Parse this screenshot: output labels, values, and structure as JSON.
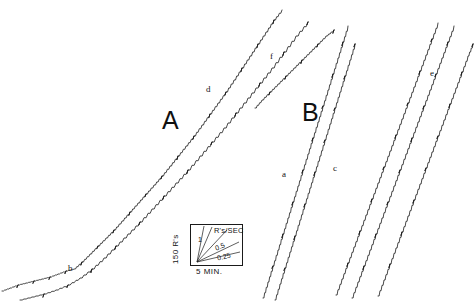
{
  "figure": {
    "background_color": "#ffffff",
    "ink_color": "#1a1a1a",
    "width": 474,
    "height": 305
  },
  "panels": [
    {
      "id": "A",
      "label": "A"
    },
    {
      "id": "B",
      "label": "B"
    }
  ],
  "curve_labels": [
    {
      "id": "b",
      "label": "b",
      "panel": "A",
      "x": 68,
      "y": 264
    },
    {
      "id": "d",
      "label": "d",
      "panel": "A",
      "x": 206,
      "y": 85
    },
    {
      "id": "f",
      "label": "f",
      "panel": "A",
      "x": 270,
      "y": 52
    },
    {
      "id": "a",
      "label": "a",
      "panel": "B",
      "x": 282,
      "y": 170
    },
    {
      "id": "c",
      "label": "c",
      "panel": "B",
      "x": 333,
      "y": 164
    },
    {
      "id": "e",
      "label": "e",
      "panel": "B",
      "x": 430,
      "y": 69
    }
  ],
  "inset": {
    "name": "rate-calibration-inset",
    "y_axis_label": "150 R's",
    "x_axis_label": "5 MIN.",
    "rate_unit_label": "R's/SEC",
    "slope_labels": [
      "1",
      "0.5",
      "0.25"
    ]
  },
  "chart_data": {
    "type": "line",
    "title": "",
    "xlabel": "5 MIN.",
    "ylabel": "150 R's",
    "grid": false,
    "legend": "none",
    "calibration": {
      "y_per_division": 150,
      "y_units": "R's",
      "x_per_division": 5,
      "x_units": "MIN.",
      "rate_unit": "R's/SEC",
      "reference_slopes": [
        1,
        0.5,
        0.25
      ]
    },
    "series": [
      {
        "name": "b",
        "panel": "A",
        "points": [
          [
            2,
            291
          ],
          [
            10,
            288
          ],
          [
            18,
            285
          ],
          [
            26,
            283
          ],
          [
            34,
            281
          ],
          [
            42,
            279
          ],
          [
            50,
            277
          ],
          [
            58,
            274
          ],
          [
            66,
            271
          ],
          [
            74,
            269
          ],
          [
            82,
            262
          ],
          [
            90,
            254
          ],
          [
            98,
            246
          ],
          [
            106,
            238
          ],
          [
            114,
            230
          ],
          [
            122,
            221
          ],
          [
            130,
            212
          ],
          [
            138,
            203
          ],
          [
            146,
            194
          ],
          [
            154,
            185
          ],
          [
            162,
            176
          ],
          [
            170,
            166
          ],
          [
            178,
            156
          ],
          [
            186,
            146
          ],
          [
            194,
            136
          ],
          [
            202,
            125
          ],
          [
            210,
            114
          ],
          [
            218,
            103
          ],
          [
            226,
            92
          ],
          [
            234,
            80
          ],
          [
            242,
            68
          ],
          [
            250,
            56
          ],
          [
            258,
            44
          ],
          [
            266,
            32
          ],
          [
            274,
            20
          ],
          [
            282,
            10
          ]
        ]
      },
      {
        "name": "d",
        "panel": "A",
        "points": [
          [
            20,
            300
          ],
          [
            32,
            297
          ],
          [
            44,
            294
          ],
          [
            56,
            290
          ],
          [
            68,
            285
          ],
          [
            80,
            278
          ],
          [
            92,
            269
          ],
          [
            104,
            258
          ],
          [
            116,
            246
          ],
          [
            128,
            234
          ],
          [
            140,
            222
          ],
          [
            152,
            209
          ],
          [
            164,
            196
          ],
          [
            176,
            183
          ],
          [
            188,
            170
          ],
          [
            200,
            156
          ],
          [
            212,
            142
          ],
          [
            224,
            128
          ],
          [
            236,
            113
          ],
          [
            248,
            98
          ],
          [
            260,
            83
          ],
          [
            272,
            68
          ],
          [
            284,
            52
          ],
          [
            296,
            36
          ],
          [
            308,
            22
          ]
        ]
      },
      {
        "name": "f",
        "panel": "A",
        "points": [
          [
            255,
            108
          ],
          [
            262,
            100
          ],
          [
            270,
            92
          ],
          [
            278,
            84
          ],
          [
            286,
            76
          ],
          [
            294,
            68
          ],
          [
            302,
            60
          ],
          [
            310,
            52
          ],
          [
            318,
            44
          ],
          [
            326,
            36
          ],
          [
            334,
            30
          ]
        ]
      },
      {
        "name": "a",
        "panel": "B",
        "points": [
          [
            263,
            298
          ],
          [
            268,
            282
          ],
          [
            273,
            266
          ],
          [
            278,
            250
          ],
          [
            283,
            234
          ],
          [
            288,
            218
          ],
          [
            293,
            202
          ],
          [
            298,
            186
          ],
          [
            303,
            170
          ],
          [
            308,
            154
          ],
          [
            313,
            138
          ],
          [
            318,
            122
          ],
          [
            323,
            106
          ],
          [
            328,
            90
          ],
          [
            333,
            74
          ],
          [
            338,
            58
          ],
          [
            343,
            42
          ],
          [
            348,
            26
          ]
        ]
      },
      {
        "name": "a2",
        "panel": "B",
        "points": [
          [
            275,
            300
          ],
          [
            280,
            284
          ],
          [
            285,
            268
          ],
          [
            290,
            252
          ],
          [
            295,
            236
          ],
          [
            300,
            220
          ],
          [
            305,
            204
          ],
          [
            310,
            188
          ],
          [
            315,
            172
          ],
          [
            320,
            156
          ],
          [
            325,
            140
          ],
          [
            330,
            124
          ],
          [
            335,
            108
          ],
          [
            340,
            92
          ],
          [
            345,
            76
          ],
          [
            350,
            60
          ],
          [
            355,
            44
          ]
        ]
      },
      {
        "name": "c",
        "panel": "B",
        "points": [
          [
            336,
            295
          ],
          [
            342,
            279
          ],
          [
            348,
            263
          ],
          [
            354,
            247
          ],
          [
            360,
            231
          ],
          [
            366,
            215
          ],
          [
            372,
            199
          ],
          [
            378,
            183
          ],
          [
            384,
            167
          ],
          [
            390,
            151
          ],
          [
            396,
            135
          ],
          [
            402,
            119
          ],
          [
            408,
            103
          ],
          [
            414,
            87
          ],
          [
            420,
            71
          ],
          [
            426,
            55
          ],
          [
            432,
            39
          ],
          [
            438,
            23
          ]
        ]
      },
      {
        "name": "c2",
        "panel": "B",
        "points": [
          [
            352,
            298
          ],
          [
            358,
            282
          ],
          [
            364,
            266
          ],
          [
            370,
            250
          ],
          [
            376,
            234
          ],
          [
            382,
            218
          ],
          [
            388,
            202
          ],
          [
            394,
            186
          ],
          [
            400,
            170
          ],
          [
            406,
            154
          ],
          [
            412,
            138
          ],
          [
            418,
            122
          ],
          [
            424,
            106
          ],
          [
            430,
            90
          ],
          [
            436,
            74
          ],
          [
            442,
            58
          ],
          [
            448,
            42
          ],
          [
            454,
            26
          ]
        ]
      },
      {
        "name": "e",
        "panel": "B",
        "points": [
          [
            378,
            296
          ],
          [
            384,
            280
          ],
          [
            390,
            264
          ],
          [
            396,
            248
          ],
          [
            402,
            232
          ],
          [
            408,
            216
          ],
          [
            414,
            200
          ],
          [
            420,
            184
          ],
          [
            426,
            168
          ],
          [
            432,
            152
          ],
          [
            438,
            136
          ],
          [
            444,
            120
          ],
          [
            450,
            104
          ],
          [
            456,
            88
          ],
          [
            462,
            72
          ],
          [
            468,
            56
          ],
          [
            473,
            44
          ]
        ]
      }
    ]
  }
}
